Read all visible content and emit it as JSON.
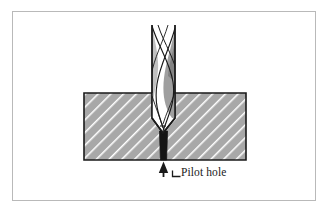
{
  "figure": {
    "kind": "technical-cross-section-illustration",
    "frame": {
      "border_color": "#b9b9b9",
      "background_color": "#ffffff"
    },
    "workpiece": {
      "name": "workpiece-block",
      "fill_color": "#a8a8a8",
      "hatch_color": "#ffffff",
      "outline_color": "#1a1a1a",
      "section_hatch_angle_deg": 45
    },
    "drill": {
      "name": "twist-drill-bit",
      "body_color": "#ffffff",
      "outline_color": "#1a1a1a",
      "flute_shade_color": "#9a9a9a",
      "point_angle_deg": 118
    },
    "pilot_hole": {
      "name": "pilot-hole",
      "fill_color": "#141414"
    },
    "annotations": [
      {
        "id": "pilot-hole-callout",
        "label": "Pilot hole",
        "leader": "arrow-up",
        "arrow_color": "#1a1a1a"
      }
    ]
  },
  "labels": {
    "pilot_hole": "Pilot hole"
  }
}
